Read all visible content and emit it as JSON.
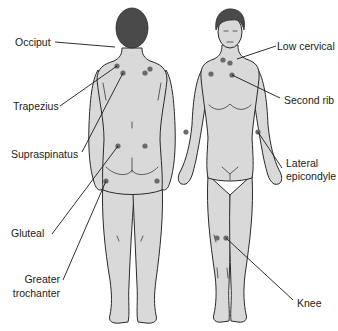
{
  "figure": {
    "views": [
      "back",
      "front"
    ],
    "colors": {
      "background": "#ffffff",
      "skin": "#d9d9d9",
      "outline": "#2a2a2a",
      "hair": "#4a4a4a",
      "tender_point": "#6a6a6a",
      "label_text": "#1a1a1a"
    }
  },
  "labels": {
    "occiput": "Occiput",
    "trapezius": "Trapezius",
    "supraspinatus": "Supraspinatus",
    "gluteal": "Gluteal",
    "greater_trochanter_1": "Greater",
    "greater_trochanter_2": "trochanter",
    "low_cervical": "Low cervical",
    "second_rib": "Second rib",
    "lateral_epicondyle_1": "Lateral",
    "lateral_epicondyle_2": "epicondyle",
    "knee": "Knee"
  }
}
